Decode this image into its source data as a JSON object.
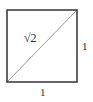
{
  "diagram": {
    "square": {
      "x": 7,
      "y": 10,
      "width": 70,
      "height": 72,
      "stroke": "#333333",
      "stroke_width": 1.5
    },
    "diagonal": {
      "x1": 7,
      "y1": 82,
      "x2": 77,
      "y2": 10,
      "stroke": "#9a9a9a",
      "stroke_width": 1
    },
    "labels": {
      "diagonal": "√2",
      "right_side": "1",
      "bottom_side": "1"
    },
    "colors": {
      "border": "#333333",
      "diagonal": "#9a9a9a",
      "text": "#333333",
      "background": "#ffffff"
    }
  }
}
